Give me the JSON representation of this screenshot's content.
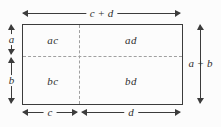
{
  "diagram": {
    "top_dimension": "c + d",
    "right_dimension": "a + b",
    "left_dimension_top": "a",
    "left_dimension_bottom": "b",
    "bottom_dimension_left": "c",
    "bottom_dimension_right": "d",
    "quadrant_top_left": "ac",
    "quadrant_top_right": "ad",
    "quadrant_bottom_left": "bc",
    "quadrant_bottom_right": "bd",
    "colors": {
      "line": "#3c3c3c",
      "dashed": "#a0a0a0",
      "text": "#2f2f2f",
      "background": "#fcfcfc"
    }
  }
}
